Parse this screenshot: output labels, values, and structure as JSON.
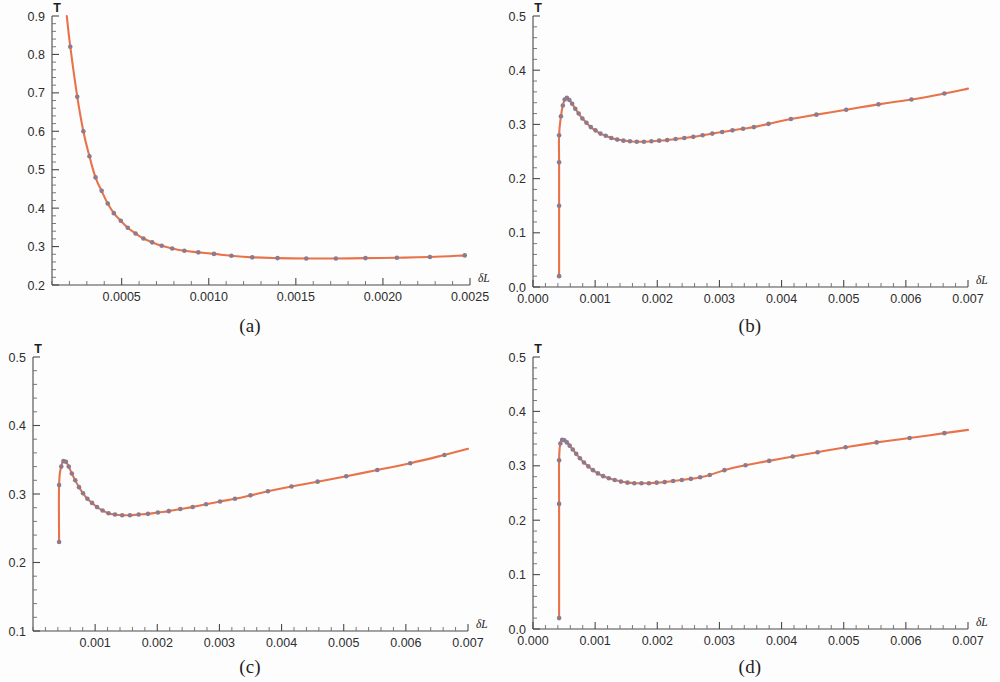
{
  "figure": {
    "title": "",
    "panel_count": 4,
    "line_color": "#e8734a",
    "marker_color": "#8c7b8e",
    "axis_color": "#4a4a4a",
    "background": "#ffffff"
  },
  "panels": [
    {
      "id": "a",
      "caption": "(a)",
      "xlabel": "δL",
      "ylabel": "T"
    },
    {
      "id": "b",
      "caption": "(b)",
      "xlabel": "δL",
      "ylabel": "T"
    },
    {
      "id": "c",
      "caption": "(c)",
      "xlabel": "δL",
      "ylabel": "T"
    },
    {
      "id": "d",
      "caption": "(d)",
      "xlabel": "δL",
      "ylabel": "T"
    }
  ],
  "chart_data": [
    {
      "type": "line",
      "panel": "a",
      "title": "(a)",
      "xlabel": "δL",
      "ylabel": "T",
      "xlim": [
        0.0001,
        0.0025
      ],
      "ylim": [
        0.2,
        0.9
      ],
      "xticks": [
        0.0005,
        0.001,
        0.0015,
        0.002,
        0.0025
      ],
      "xtick_labels": [
        "0.0005",
        "0.0010",
        "0.0015",
        "0.0020",
        "0.0025"
      ],
      "yticks": [
        0.2,
        0.3,
        0.4,
        0.5,
        0.6,
        0.7,
        0.8,
        0.9
      ],
      "ytick_labels": [
        "0.2",
        "0.3",
        "0.4",
        "0.5",
        "0.6",
        "0.7",
        "0.8",
        "0.9"
      ],
      "xminor_step": 0.0001,
      "yminor_step": 0.02,
      "grid": false,
      "legend": "none",
      "series": [
        {
          "name": "T",
          "markers": true,
          "x": [
            0.000205,
            0.000245,
            0.00028,
            0.000315,
            0.00035,
            0.000385,
            0.00042,
            0.000455,
            0.000495,
            0.000535,
            0.00058,
            0.000625,
            0.000675,
            0.00073,
            0.00079,
            0.00086,
            0.00094,
            0.00103,
            0.00113,
            0.00125,
            0.001395,
            0.00156,
            0.00173,
            0.0019,
            0.00208,
            0.00227,
            0.00247
          ],
          "y": [
            0.82,
            0.69,
            0.6,
            0.535,
            0.48,
            0.445,
            0.412,
            0.387,
            0.367,
            0.349,
            0.334,
            0.321,
            0.311,
            0.302,
            0.295,
            0.289,
            0.285,
            0.281,
            0.276,
            0.272,
            0.27,
            0.269,
            0.269,
            0.27,
            0.271,
            0.273,
            0.277
          ],
          "curve_x_start": 0.000185,
          "curve_y_start": 0.9
        }
      ]
    },
    {
      "type": "line",
      "panel": "b",
      "title": "(b)",
      "xlabel": "δL",
      "ylabel": "T",
      "xlim": [
        0.0,
        0.007
      ],
      "ylim": [
        0.0,
        0.5
      ],
      "xticks": [
        0.0,
        0.001,
        0.002,
        0.003,
        0.004,
        0.005,
        0.006,
        0.007
      ],
      "xtick_labels": [
        "0.000",
        "0.001",
        "0.002",
        "0.003",
        "0.004",
        "0.005",
        "0.006",
        "0.007"
      ],
      "yticks": [
        0.0,
        0.1,
        0.2,
        0.3,
        0.4,
        0.5
      ],
      "ytick_labels": [
        "0.0",
        "0.1",
        "0.2",
        "0.3",
        "0.4",
        "0.5"
      ],
      "xminor_step": 0.0002,
      "yminor_step": 0.02,
      "grid": false,
      "legend": "none",
      "series": [
        {
          "name": "T",
          "markers": true,
          "x": [
            0.00042,
            0.00042,
            0.00042,
            0.00042,
            0.00045,
            0.00048,
            0.00051,
            0.000545,
            0.000585,
            0.00063,
            0.00068,
            0.000735,
            0.000795,
            0.00086,
            0.00093,
            0.001005,
            0.001085,
            0.00117,
            0.00126,
            0.001355,
            0.001455,
            0.00156,
            0.00167,
            0.001785,
            0.001905,
            0.00203,
            0.00216,
            0.002295,
            0.002435,
            0.00258,
            0.00273,
            0.002885,
            0.003045,
            0.00321,
            0.00338,
            0.003555,
            0.00379,
            0.00415,
            0.00456,
            0.00504,
            0.00556,
            0.00609,
            0.00662
          ],
          "y": [
            0.02,
            0.15,
            0.23,
            0.28,
            0.315,
            0.335,
            0.346,
            0.349,
            0.345,
            0.338,
            0.329,
            0.32,
            0.311,
            0.303,
            0.295,
            0.289,
            0.283,
            0.279,
            0.275,
            0.272,
            0.27,
            0.269,
            0.268,
            0.268,
            0.269,
            0.27,
            0.271,
            0.273,
            0.275,
            0.277,
            0.28,
            0.283,
            0.286,
            0.289,
            0.292,
            0.295,
            0.301,
            0.31,
            0.318,
            0.327,
            0.337,
            0.346,
            0.357
          ],
          "curve_x_end": 0.007,
          "curve_y_end": 0.366
        }
      ]
    },
    {
      "type": "line",
      "panel": "c",
      "title": "(c)",
      "xlabel": "δL",
      "ylabel": "T",
      "xlim": [
        0.0,
        0.007
      ],
      "ylim": [
        0.1,
        0.5
      ],
      "xticks": [
        0.001,
        0.002,
        0.003,
        0.004,
        0.005,
        0.006,
        0.007
      ],
      "xtick_labels": [
        "0.001",
        "0.002",
        "0.003",
        "0.004",
        "0.005",
        "0.006",
        "0.007"
      ],
      "yticks": [
        0.1,
        0.2,
        0.3,
        0.4,
        0.5
      ],
      "ytick_labels": [
        "0.1",
        "0.2",
        "0.3",
        "0.4",
        "0.5"
      ],
      "xminor_step": 0.0002,
      "yminor_step": 0.02,
      "grid": false,
      "legend": "none",
      "series": [
        {
          "name": "T",
          "markers": true,
          "x": [
            0.00042,
            0.00042,
            0.000455,
            0.00049,
            0.00053,
            0.000575,
            0.000625,
            0.00068,
            0.00074,
            0.000805,
            0.000875,
            0.00095,
            0.00103,
            0.00112,
            0.001215,
            0.00132,
            0.001435,
            0.00156,
            0.0017,
            0.00185,
            0.00201,
            0.002185,
            0.00237,
            0.00257,
            0.002785,
            0.00301,
            0.00325,
            0.0035,
            0.00378,
            0.00416,
            0.00458,
            0.00504,
            0.00554,
            0.00607,
            0.00662
          ],
          "y": [
            0.23,
            0.313,
            0.34,
            0.348,
            0.347,
            0.34,
            0.33,
            0.32,
            0.31,
            0.301,
            0.293,
            0.287,
            0.281,
            0.276,
            0.272,
            0.27,
            0.269,
            0.269,
            0.27,
            0.271,
            0.273,
            0.275,
            0.278,
            0.281,
            0.285,
            0.289,
            0.293,
            0.298,
            0.304,
            0.311,
            0.318,
            0.326,
            0.335,
            0.345,
            0.357
          ],
          "curve_x_end": 0.007,
          "curve_y_end": 0.366
        }
      ]
    },
    {
      "type": "line",
      "panel": "d",
      "title": "(d)",
      "xlabel": "δL",
      "ylabel": "T",
      "xlim": [
        0.0,
        0.007
      ],
      "ylim": [
        0.0,
        0.5
      ],
      "xticks": [
        0.0,
        0.001,
        0.002,
        0.003,
        0.004,
        0.005,
        0.006,
        0.007
      ],
      "xtick_labels": [
        "0.000",
        "0.001",
        "0.002",
        "0.003",
        "0.004",
        "0.005",
        "0.006",
        "0.007"
      ],
      "yticks": [
        0.0,
        0.1,
        0.2,
        0.3,
        0.4,
        0.5
      ],
      "ytick_labels": [
        "0.0",
        "0.1",
        "0.2",
        "0.3",
        "0.4",
        "0.5"
      ],
      "xminor_step": 0.0002,
      "yminor_step": 0.02,
      "grid": false,
      "legend": "none",
      "series": [
        {
          "name": "T",
          "markers": true,
          "x": [
            0.00042,
            0.00042,
            0.00042,
            0.00044,
            0.00047,
            0.000505,
            0.000545,
            0.00059,
            0.00064,
            0.000695,
            0.000755,
            0.00082,
            0.00089,
            0.000965,
            0.001045,
            0.00113,
            0.00122,
            0.001315,
            0.001415,
            0.00152,
            0.00163,
            0.001745,
            0.001865,
            0.00199,
            0.00212,
            0.002255,
            0.002395,
            0.00254,
            0.00269,
            0.002845,
            0.00308,
            0.00342,
            0.0038,
            0.00418,
            0.00458,
            0.00503,
            0.00553,
            0.00606,
            0.00662
          ],
          "y": [
            0.02,
            0.23,
            0.31,
            0.341,
            0.348,
            0.347,
            0.343,
            0.337,
            0.33,
            0.322,
            0.314,
            0.306,
            0.299,
            0.292,
            0.286,
            0.281,
            0.277,
            0.274,
            0.271,
            0.269,
            0.268,
            0.268,
            0.268,
            0.269,
            0.27,
            0.272,
            0.274,
            0.276,
            0.279,
            0.283,
            0.292,
            0.301,
            0.309,
            0.317,
            0.325,
            0.334,
            0.343,
            0.351,
            0.36
          ],
          "curve_x_end": 0.007,
          "curve_y_end": 0.366
        }
      ]
    }
  ]
}
